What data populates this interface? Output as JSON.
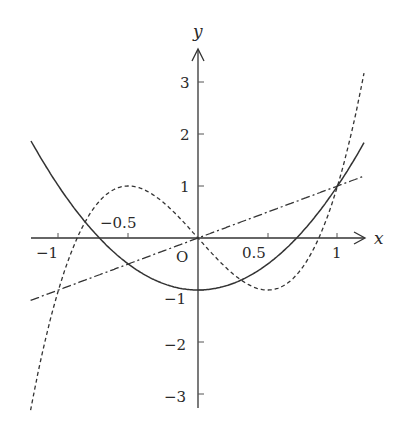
{
  "chart_data": {
    "type": "line",
    "title": "",
    "xlabel": "x",
    "ylabel": "y",
    "origin_label": "O",
    "xlim": [
      -1.2,
      1.2
    ],
    "ylim": [
      -3.3,
      3.6
    ],
    "grid": false,
    "legend": "none",
    "x_ticks": [
      {
        "value": -1,
        "label": "−1"
      },
      {
        "value": -0.5,
        "label": "−0.5"
      },
      {
        "value": 0.5,
        "label": "0.5"
      },
      {
        "value": 1,
        "label": "1"
      }
    ],
    "y_ticks": [
      {
        "value": 3,
        "label": "3"
      },
      {
        "value": 2,
        "label": "2"
      },
      {
        "value": 1,
        "label": "1"
      },
      {
        "value": -1,
        "label": "−1"
      },
      {
        "value": -2,
        "label": "−2"
      },
      {
        "value": -3,
        "label": "−3"
      }
    ],
    "series": [
      {
        "name": "y = x",
        "style": "dash-dot",
        "x": [
          -1.2,
          -1,
          -0.5,
          0,
          0.5,
          1,
          1.2
        ],
        "values": [
          -1.2,
          -1,
          -0.5,
          0,
          0.5,
          1,
          1.2
        ]
      },
      {
        "name": "y = 2x² − 1",
        "style": "solid",
        "x": [
          -1.2,
          -1,
          -0.707,
          -0.5,
          0,
          0.5,
          0.707,
          1,
          1.2
        ],
        "values": [
          1.88,
          1,
          0,
          -0.5,
          -1,
          -0.5,
          0,
          1,
          1.88
        ]
      },
      {
        "name": "y = 4x³ − 3x",
        "style": "dashed",
        "x": [
          -1.2,
          -1,
          -0.866,
          -0.5,
          0,
          0.5,
          0.866,
          1,
          1.2
        ],
        "values": [
          -3.31,
          -1,
          0,
          1,
          0,
          -1,
          0,
          1,
          3.31
        ]
      }
    ]
  }
}
